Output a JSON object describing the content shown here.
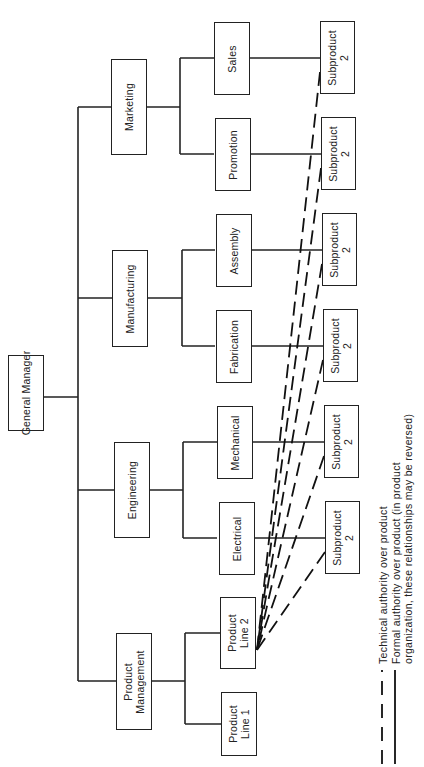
{
  "diagram": {
    "type": "organization-chart",
    "orientation": "rotated-90-ccw",
    "root": {
      "label": "General Manager"
    },
    "departments": [
      {
        "label": "Marketing",
        "children": [
          "Sales",
          "Promotion"
        ]
      },
      {
        "label": "Manufacturing",
        "children": [
          "Assembly",
          "Fabrication"
        ]
      },
      {
        "label": "Engineering",
        "children": [
          "Mechanical",
          "Electrical"
        ]
      },
      {
        "label": "Product\nManagement",
        "children": [
          "Product\nLine 2",
          "Product\nLine 1"
        ]
      }
    ],
    "functions": [
      {
        "label": "Sales"
      },
      {
        "label": "Promotion"
      },
      {
        "label": "Assembly"
      },
      {
        "label": "Fabrication"
      },
      {
        "label": "Mechanical"
      },
      {
        "label": "Electrical"
      }
    ],
    "product_lines": [
      {
        "label": "Product\nLine 2"
      },
      {
        "label": "Product\nLine 1"
      }
    ],
    "subproducts": [
      {
        "label": "Subproduct\n2",
        "reports_to": "Sales"
      },
      {
        "label": "Subproduct\n2",
        "reports_to": "Promotion"
      },
      {
        "label": "Subproduct\n2",
        "reports_to": "Assembly"
      },
      {
        "label": "Subproduct\n2",
        "reports_to": "Fabrication"
      },
      {
        "label": "Subproduct\n2",
        "reports_to": "Mechanical"
      },
      {
        "label": "Subproduct\n2",
        "reports_to": "Electrical"
      }
    ],
    "dashed_links": {
      "target": "Product Line 2",
      "sources": [
        "Subproduct 2 (Sales)",
        "Subproduct 2 (Promotion)",
        "Subproduct 2 (Assembly)",
        "Subproduct 2 (Fabrication)",
        "Subproduct 2 (Mechanical)",
        "Subproduct 2 (Electrical)"
      ]
    }
  },
  "legend": {
    "dashed": "Technical authority over product",
    "solid_line1": "Formal authority over product (in product",
    "solid_line2": "organization, these relationships may be reversed)"
  },
  "colors": {
    "ink": "#222222",
    "background": "#ffffff"
  }
}
